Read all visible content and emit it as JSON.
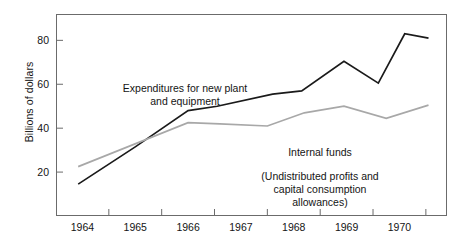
{
  "chart_data": {
    "type": "line",
    "title": "",
    "xlabel": "",
    "ylabel": "Billions of dollars",
    "ylim": [
      0,
      92
    ],
    "xlim": [
      1963.5,
      1970.9
    ],
    "yticks": [
      20,
      40,
      60,
      80
    ],
    "ytick_labels": [
      "20",
      "40",
      "60",
      "80"
    ],
    "categories": [
      "1964",
      "1965",
      "1966",
      "1967",
      "1968",
      "1969",
      "1970"
    ],
    "xtick_labels": [
      "1964",
      "1965",
      "1966",
      "1967",
      "1968",
      "1969",
      "1970"
    ],
    "grid": false,
    "legend": "inline-annotations",
    "series": [
      {
        "name": "Expenditures for new plant and equipment",
        "color": "#1a1a1a",
        "x": [
          1963.92,
          1965.0,
          1966.0,
          1966.55,
          1967.6,
          1968.15,
          1968.95,
          1969.6,
          1970.1,
          1970.55
        ],
        "values": [
          14.5,
          31.5,
          48.0,
          50.0,
          55.5,
          57.0,
          70.5,
          60.5,
          83.0,
          81.0
        ]
      },
      {
        "name": "Internal funds",
        "color": "#a8a8a8",
        "x": [
          1963.92,
          1966.0,
          1966.6,
          1967.5,
          1968.2,
          1968.95,
          1969.75,
          1970.55
        ],
        "values": [
          22.5,
          42.5,
          42.0,
          41.0,
          47.0,
          50.0,
          44.5,
          50.5
        ]
      }
    ],
    "annotations": [
      {
        "id": "expenditures",
        "text": "Expenditures for new plant\nand equipment"
      },
      {
        "id": "internal_funds",
        "text": "Internal funds"
      },
      {
        "id": "internal_funds_sub",
        "text": "(Undistributed profits and\ncapital consumption\nallowances)"
      }
    ]
  },
  "axis": {
    "y_title": "Billions of dollars"
  },
  "colors": {
    "expenditures_line": "#1a1a1a",
    "internal_funds_line": "#a8a8a8",
    "frame": "#6b6b6b",
    "background": "#ffffff",
    "text": "#141414"
  }
}
